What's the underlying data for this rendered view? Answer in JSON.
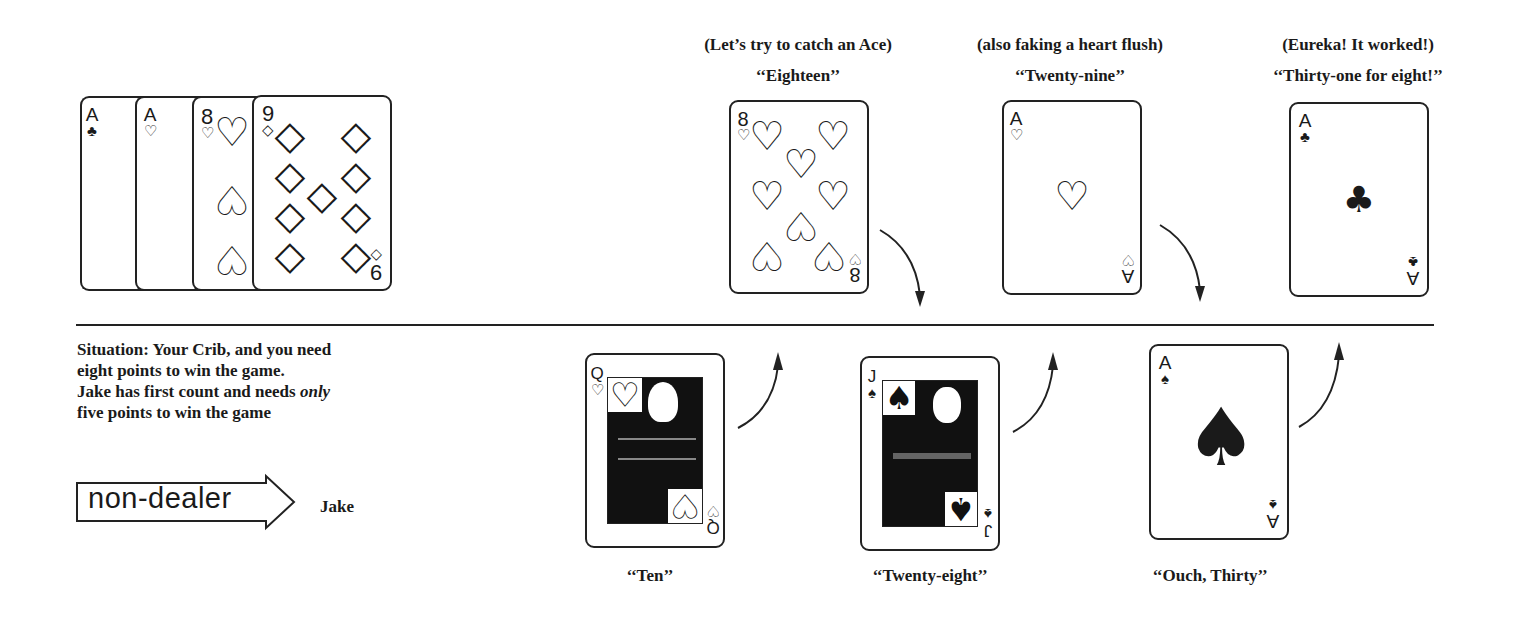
{
  "hand": {
    "label": "Your hand",
    "cards": [
      {
        "rank": "A",
        "suit": "♣",
        "suit_name": "clubs"
      },
      {
        "rank": "A",
        "suit": "♡",
        "suit_name": "hearts"
      },
      {
        "rank": "8",
        "suit": "♡",
        "suit_name": "hearts"
      },
      {
        "rank": "9",
        "suit": "◇",
        "suit_name": "diamonds"
      }
    ]
  },
  "top_row": [
    {
      "note": "(Let’s try to catch an Ace)",
      "call": "‘‘Eighteen’’",
      "rank": "8",
      "suit": "♡",
      "suit_name": "hearts"
    },
    {
      "note": "(also faking a heart flush)",
      "call": "‘‘Twenty-nine’’",
      "rank": "A",
      "suit": "♡",
      "suit_name": "hearts"
    },
    {
      "note": "(Eureka! It worked!)",
      "call": "‘‘Thirty-one for eight!’’",
      "rank": "A",
      "suit": "♣",
      "suit_name": "clubs"
    }
  ],
  "bottom_row": [
    {
      "call": "‘‘Ten’’",
      "rank": "Q",
      "suit": "♡",
      "suit_name": "hearts"
    },
    {
      "call": "‘‘Twenty-eight’’",
      "rank": "J",
      "suit": "♠",
      "suit_name": "spades"
    },
    {
      "call": "‘‘Ouch, Thirty’’",
      "rank": "A",
      "suit": "♠",
      "suit_name": "spades"
    }
  ],
  "situation": {
    "line1": "Situation: Your Crib, and you need",
    "line2": "eight points to win the game.",
    "line3_pre": "Jake has first count and needs ",
    "line3_em": "only",
    "line4": "five points to win the game"
  },
  "role": {
    "badge": "non-dealer",
    "player": "Jake"
  }
}
